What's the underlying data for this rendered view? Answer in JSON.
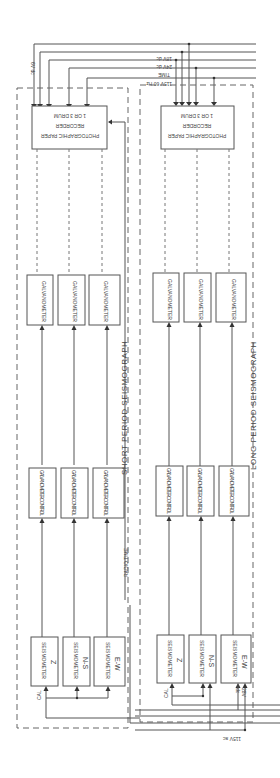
{
  "diagram": {
    "orientation": "rotated-180",
    "systems": [
      {
        "title": "SHORT PERIOD SEISMOGRAPH",
        "seismometers": [
          {
            "label": "SEISMOMETER",
            "axis": "Z"
          },
          {
            "label": "SEISMOMETER",
            "axis": "N-S"
          },
          {
            "label": "SEISMOMETER",
            "axis": "E-W"
          }
        ],
        "controls": [
          "GALVANOMETER CONTROL",
          "GALVANOMETER CONTROL",
          "GALVANOMETER CONTROL"
        ],
        "galvanometers": [
          "GALVANOMETER",
          "GALVANOMETER",
          "GALVANOMETER"
        ],
        "recorder": {
          "line1": "PHOTOGRAPHIC PAPER",
          "line2": "RECORDER",
          "line3": "1 OR 3 DRUM"
        },
        "cal_label": "CAL",
        "radio_time_label": "RADIO TIME"
      },
      {
        "title": "LONG PERIOD SEISMOGRAPH",
        "seismometers": [
          {
            "label": "SEISMOMETER",
            "axis": "Z"
          },
          {
            "label": "SEISMOMETER",
            "axis": "N-S"
          },
          {
            "label": "SEISMOMETER",
            "axis": "E-W"
          }
        ],
        "controls": [
          "GALVANOMETER CONTROL",
          "GALVANOMETER CONTROL",
          "GALVANOMETER CONTROL"
        ],
        "galvanometers": [
          "GALVANOMETER",
          "GALVANOMETER",
          "GALVANOMETER"
        ],
        "recorder": {
          "line1": "PHOTOGRAPHIC PAPER",
          "line2": "RECORDER",
          "line3": "1 OR 3 DRUM"
        },
        "cal_label": "CAL",
        "side_label_1": "28V",
        "side_label_2": "dc"
      }
    ],
    "power_lines": [
      "6V dc",
      "18V dc",
      "24V dc",
      "TIME",
      "115V 60 Hz"
    ],
    "bottom_label": "115V ac"
  }
}
